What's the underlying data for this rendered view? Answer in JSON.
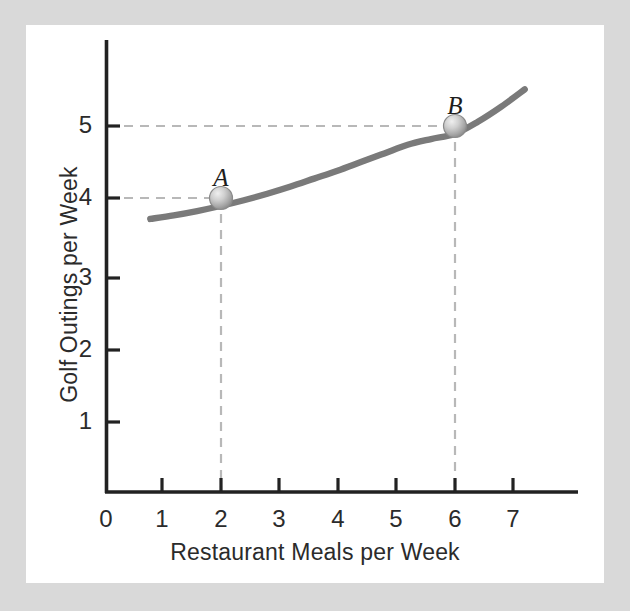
{
  "chart_data": {
    "type": "line",
    "title": "",
    "xlabel": "Restaurant Meals per Week",
    "ylabel": "Golf Outings per Week",
    "xlim": [
      0,
      8.05
    ],
    "ylim": [
      0,
      6.28
    ],
    "xticks": [
      "1",
      "2",
      "3",
      "4",
      "5",
      "6",
      "7"
    ],
    "xtick_values": [
      1,
      2,
      3,
      4,
      5,
      6,
      7
    ],
    "yticks": [
      "1",
      "2",
      "3",
      "4",
      "5"
    ],
    "ytick_values": [
      1,
      2,
      3,
      4,
      5
    ],
    "origin_label": "0",
    "grid": false,
    "legend": null,
    "series": [
      {
        "name": "indifference-curve",
        "kind": "curve",
        "color": "#7a7a7a",
        "x": [
          0.8,
          1.2,
          1.6,
          2.0,
          2.4,
          2.8,
          3.2,
          3.6,
          4.0,
          4.4,
          4.8,
          5.2,
          5.6,
          6.0,
          6.4,
          6.8,
          7.2
        ],
        "y": [
          3.82,
          3.87,
          3.93,
          4.0,
          4.08,
          4.17,
          4.27,
          4.38,
          4.49,
          4.61,
          4.73,
          4.85,
          4.93,
          5.0,
          5.17,
          5.38,
          5.62
        ]
      }
    ],
    "annotations": [
      {
        "label": "A",
        "x": 2,
        "y": 4,
        "marker": "sphere",
        "color": "#b4b4b4",
        "guides": [
          "horizontal",
          "vertical"
        ]
      },
      {
        "label": "B",
        "x": 6,
        "y": 5,
        "marker": "sphere",
        "color": "#b4b4b4",
        "guides": [
          "horizontal",
          "vertical"
        ]
      }
    ]
  },
  "colors": {
    "frame": "#d9d9d9",
    "plate": "#ffffff",
    "axis": "#222222",
    "curve": "#7a7a7a",
    "guide": "#b8b8b8",
    "text": "#2b2b2b",
    "marker_fill": "#b9b9b9",
    "marker_edge": "#8a8a8a"
  }
}
